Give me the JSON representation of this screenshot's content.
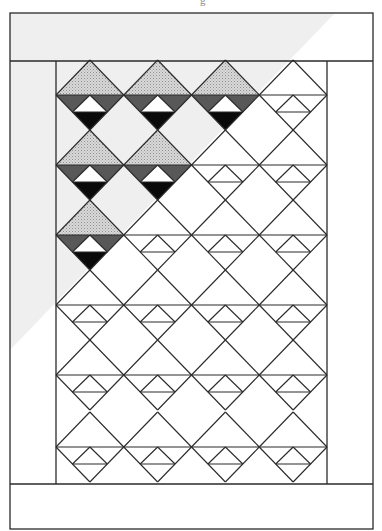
{
  "caption_fragment": "g",
  "quilt": {
    "outer_border": {
      "x": 10,
      "y": 13,
      "width": 363,
      "height": 516
    },
    "top_band_bottom_y": 61,
    "bottom_band_top_y": 484,
    "inner_left_x": 56,
    "inner_right_x": 327,
    "columns": 4,
    "block_width": 67.75,
    "first_row_top_y": 61,
    "row_horizontals_y": [
      95,
      165,
      235,
      305,
      375,
      447
    ],
    "half_height": 35,
    "small_triangle_base_offset": 17,
    "colored_blocks": [
      {
        "row": 0,
        "cols": [
          0,
          1,
          2
        ]
      },
      {
        "row": 1,
        "cols": [
          0,
          1
        ]
      },
      {
        "row": 2,
        "cols": [
          0
        ]
      }
    ],
    "colors": {
      "line": "#2a2a2a",
      "stipple_light": "#d4d4d4",
      "stipple_dot": "#9a9a9a",
      "dark_gray": "#585858",
      "black": "#0a0a0a",
      "white": "#ffffff",
      "shading": "#ececec"
    }
  }
}
